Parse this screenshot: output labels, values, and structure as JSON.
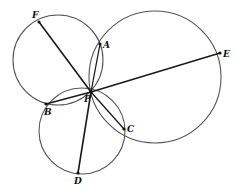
{
  "diagram": {
    "type": "geometry",
    "points": {
      "F": {
        "label": "F",
        "x": 39,
        "y": 22
      },
      "A": {
        "label": "A",
        "x": 100,
        "y": 44
      },
      "E": {
        "label": "E",
        "x": 220,
        "y": 53
      },
      "P": {
        "label": "P",
        "x": 91,
        "y": 92
      },
      "B": {
        "label": "B",
        "x": 46,
        "y": 104
      },
      "C": {
        "label": "C",
        "x": 124,
        "y": 129
      },
      "D": {
        "label": "D",
        "x": 78,
        "y": 173
      }
    },
    "circles": [
      {
        "name": "upper-left-circle",
        "cx": 58,
        "cy": 60,
        "r": 45,
        "through": [
          "F",
          "A",
          "P",
          "B"
        ]
      },
      {
        "name": "right-circle",
        "cx": 155,
        "cy": 77,
        "r": 66,
        "through": [
          "A",
          "E",
          "C",
          "P"
        ]
      },
      {
        "name": "lower-circle",
        "cx": 82,
        "cy": 131,
        "r": 43,
        "through": [
          "B",
          "C",
          "D",
          "P"
        ]
      }
    ],
    "segments": [
      {
        "name": "segment-FP",
        "from": "F",
        "to": "P"
      },
      {
        "name": "segment-EP",
        "from": "E",
        "to": "P"
      },
      {
        "name": "segment-DP",
        "from": "D",
        "to": "P"
      },
      {
        "name": "segment-AP",
        "from": "A",
        "to": "P"
      },
      {
        "name": "segment-BP",
        "from": "B",
        "to": "P"
      },
      {
        "name": "segment-CP",
        "from": "C",
        "to": "P"
      }
    ],
    "labels": {
      "F": "F",
      "A": "A",
      "E": "E",
      "P": "P",
      "B": "B",
      "C": "C",
      "D": "D"
    },
    "colors": {
      "circle_stroke": "#555555",
      "line_stroke": "#1a1a1a",
      "background": "#ffffff"
    }
  }
}
